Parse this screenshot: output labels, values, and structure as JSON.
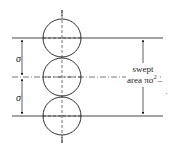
{
  "diagram": {
    "labels": {
      "sigma_top": "σ",
      "sigma_bottom": "σ",
      "swept_line1": "swept",
      "swept_line2": "area πσ",
      "swept_exp": "2",
      "swept_dash": "–",
      "stray_mark": "'"
    },
    "colors": {
      "stroke": "#1a1a1a",
      "background": "#ffffff"
    }
  }
}
